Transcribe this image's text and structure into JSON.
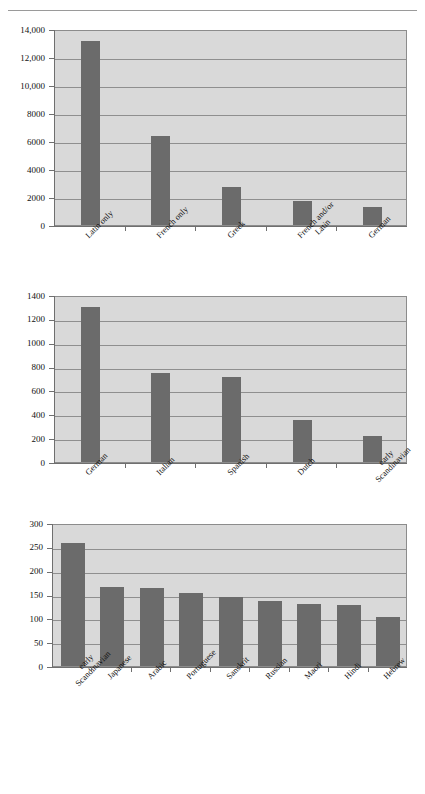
{
  "page": {
    "background_color": "#ffffff",
    "rule_color": "#9a9a9a",
    "bar_color": "#6b6b6b",
    "plot_background": "#d9d9d9",
    "grid_color": "#8f8f8f"
  },
  "chart_data": [
    {
      "type": "bar",
      "title": "",
      "xlabel": "",
      "ylabel": "",
      "categories": [
        "Latin only",
        "French only",
        "Greek",
        "French and/or Latin",
        "German"
      ],
      "category_lines": [
        [
          "Latin only"
        ],
        [
          "French only"
        ],
        [
          "Greek"
        ],
        [
          "French and/or",
          "Latin"
        ],
        [
          "German"
        ]
      ],
      "values": [
        13150,
        6350,
        2750,
        1720,
        1300
      ],
      "ylim": [
        0,
        14000
      ],
      "ytick_values": [
        0,
        2000,
        4000,
        6000,
        8000,
        10000,
        12000,
        14000
      ],
      "ytick_labels": [
        "0",
        "2000",
        "4000",
        "6000",
        "8000",
        "10,000",
        "12,000",
        "14,000"
      ],
      "grid": true,
      "legend": "none"
    },
    {
      "type": "bar",
      "title": "",
      "xlabel": "",
      "ylabel": "",
      "categories": [
        "German",
        "Italian",
        "Spanish",
        "Dutch",
        "early Scandinavian"
      ],
      "category_lines": [
        [
          "German"
        ],
        [
          "Italian"
        ],
        [
          "Spanish"
        ],
        [
          "Dutch"
        ],
        [
          "early",
          "Scandinavian"
        ]
      ],
      "values": [
        1300,
        745,
        715,
        350,
        220
      ],
      "ylim": [
        0,
        1400
      ],
      "ytick_values": [
        0,
        200,
        400,
        600,
        800,
        1000,
        1200,
        1400
      ],
      "ytick_labels": [
        "0",
        "200",
        "400",
        "600",
        "800",
        "1000",
        "1200",
        "1400"
      ],
      "grid": true,
      "legend": "none"
    },
    {
      "type": "bar",
      "title": "",
      "xlabel": "",
      "ylabel": "",
      "categories": [
        "early Scandinavian",
        "Japanese",
        "Arabic",
        "Portuguese",
        "Sanskrit",
        "Russian",
        "Maori",
        "Hindi",
        "Hebrew"
      ],
      "category_lines": [
        [
          "early",
          "Scandinavian"
        ],
        [
          "Japanese"
        ],
        [
          "Arabic"
        ],
        [
          "Portuguese"
        ],
        [
          "Sanskrit"
        ],
        [
          "Russian"
        ],
        [
          "Maori"
        ],
        [
          "Hindi"
        ],
        [
          "Hebrew"
        ]
      ],
      "values": [
        258,
        166,
        163,
        154,
        144,
        137,
        130,
        127,
        102
      ],
      "ylim": [
        0,
        300
      ],
      "ytick_values": [
        0,
        50,
        100,
        150,
        200,
        250,
        300
      ],
      "ytick_labels": [
        "0",
        "50",
        "100",
        "150",
        "200",
        "250",
        "300"
      ],
      "grid": true,
      "legend": "none"
    }
  ]
}
